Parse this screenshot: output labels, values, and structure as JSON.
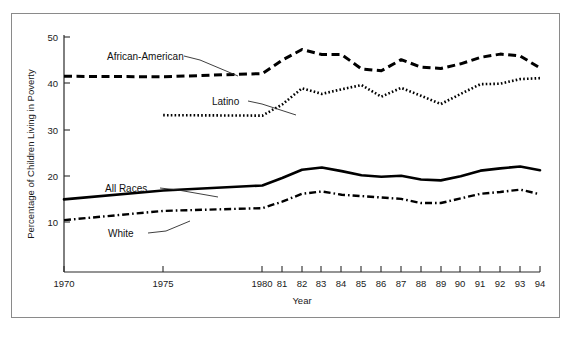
{
  "figure": {
    "border_color": "#8a8a8a",
    "background": "#ffffff"
  },
  "chart_data": {
    "type": "line",
    "title": "",
    "xlabel": "Year",
    "ylabel": "Percentage of Children Living in Poverty",
    "xlim": [
      1970,
      1994
    ],
    "ylim": [
      5,
      52
    ],
    "yticks": [
      10,
      20,
      30,
      40,
      50
    ],
    "ytick_labels": [
      "10",
      "20",
      "30",
      "40",
      "50"
    ],
    "xticks": [
      1970,
      1975,
      1980,
      1981,
      1982,
      1983,
      1984,
      1985,
      1986,
      1987,
      1988,
      1989,
      1990,
      1991,
      1992,
      1993,
      1994
    ],
    "xtick_labels": [
      "1970",
      "1975",
      "1980",
      "81",
      "82",
      "83",
      "84",
      "85",
      "86",
      "87",
      "88",
      "89",
      "90",
      "91",
      "92",
      "93",
      "94"
    ],
    "grid": false,
    "legend_position": "inline-annotations",
    "series": [
      {
        "name": "African-American",
        "style": "dashed",
        "x": [
          1970,
          1975,
          1980,
          1981,
          1982,
          1983,
          1984,
          1985,
          1986,
          1987,
          1988,
          1989,
          1990,
          1991,
          1992,
          1993,
          1994
        ],
        "values": [
          41.5,
          41.4,
          42.1,
          45.0,
          47.3,
          46.2,
          46.2,
          43.1,
          42.7,
          45.1,
          43.5,
          43.2,
          44.2,
          45.6,
          46.3,
          45.9,
          43.3
        ]
      },
      {
        "name": "Latino",
        "style": "dotted",
        "x": [
          1975,
          1980,
          1981,
          1982,
          1983,
          1984,
          1985,
          1986,
          1987,
          1988,
          1989,
          1990,
          1991,
          1992,
          1993,
          1994
        ],
        "values": [
          33.1,
          33.0,
          35.4,
          38.9,
          37.7,
          38.7,
          39.6,
          37.1,
          39.0,
          37.3,
          35.5,
          37.7,
          39.8,
          39.9,
          40.9,
          41.1
        ]
      },
      {
        "name": "All Races",
        "style": "solid",
        "x": [
          1970,
          1975,
          1980,
          1981,
          1982,
          1983,
          1984,
          1985,
          1986,
          1987,
          1988,
          1989,
          1990,
          1991,
          1992,
          1993,
          1994
        ],
        "values": [
          14.9,
          16.8,
          17.9,
          19.5,
          21.3,
          21.8,
          21.0,
          20.1,
          19.8,
          20.0,
          19.2,
          19.0,
          19.9,
          21.1,
          21.6,
          22.0,
          21.2
        ]
      },
      {
        "name": "White",
        "style": "dash-dot",
        "x": [
          1970,
          1975,
          1980,
          1981,
          1982,
          1983,
          1984,
          1985,
          1986,
          1987,
          1988,
          1989,
          1990,
          1991,
          1992,
          1993,
          1994
        ],
        "values": [
          10.4,
          12.4,
          13.0,
          14.4,
          16.1,
          16.6,
          15.9,
          15.6,
          15.3,
          15.0,
          14.1,
          14.1,
          15.1,
          16.1,
          16.5,
          17.0,
          16.0
        ]
      }
    ],
    "annotations": [
      {
        "text": "African-American",
        "x_px": 107,
        "y_px": 60
      },
      {
        "text": "Latino",
        "x_px": 212,
        "y_px": 104
      },
      {
        "text": "All Races",
        "x_px": 105,
        "y_px": 192
      },
      {
        "text": "White",
        "x_px": 108,
        "y_px": 237
      }
    ]
  }
}
